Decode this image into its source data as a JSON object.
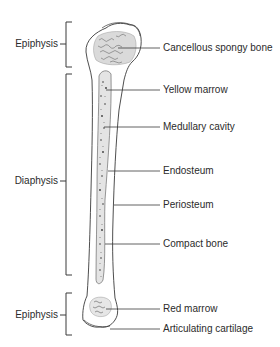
{
  "diagram": {
    "type": "long-bone-anatomy",
    "left_labels": [
      {
        "id": "epiphysis-top",
        "text": "Epiphysis",
        "y": 44
      },
      {
        "id": "diaphysis",
        "text": "Diaphysis",
        "y": 180
      },
      {
        "id": "epiphysis-bottom",
        "text": "Epiphysis",
        "y": 314
      }
    ],
    "right_labels": [
      {
        "id": "cancellous-spongy-bone",
        "text": "Cancellous spongy bone",
        "y": 46
      },
      {
        "id": "yellow-marrow",
        "text": "Yellow marrow",
        "y": 89
      },
      {
        "id": "medullary-cavity",
        "text": "Medullary cavity",
        "y": 127
      },
      {
        "id": "endosteum",
        "text": "Endosteum",
        "y": 171
      },
      {
        "id": "periosteum",
        "text": "Periosteum",
        "y": 205
      },
      {
        "id": "compact-bone",
        "text": "Compact bone",
        "y": 244
      },
      {
        "id": "red-marrow",
        "text": "Red marrow",
        "y": 309
      },
      {
        "id": "articulating-cartilage",
        "text": "Articulating cartilage",
        "y": 329
      }
    ],
    "colors": {
      "line": "#3a3a3a",
      "marrow_fill": "#e4e4e4",
      "text": "#2b2b2b"
    }
  }
}
